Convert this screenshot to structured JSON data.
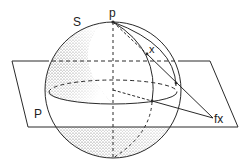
{
  "figure": {
    "colors": {
      "ink": "#2a2a2a",
      "background": "#ffffff"
    },
    "labels": {
      "sphere": "S",
      "pole": "p",
      "point": "x",
      "plane": "P",
      "projection": "fx"
    }
  }
}
